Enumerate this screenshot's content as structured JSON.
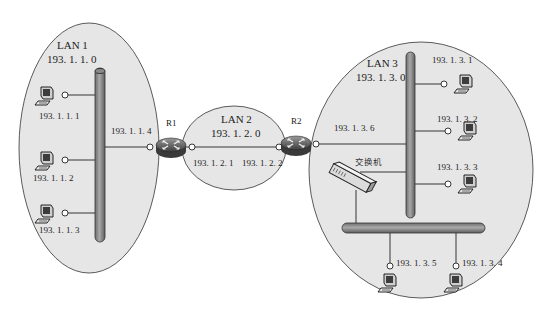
{
  "diagram": {
    "type": "network-topology",
    "colors": {
      "background": "#ffffff",
      "lan_fill": "#e6e6e6",
      "lan_stroke": "#333333",
      "bus_fill": "#8c8c8c",
      "link": "#222222",
      "router_body": "#5a5a5a"
    },
    "lans": [
      {
        "id": "lan1",
        "name": "LAN 1",
        "network": "193. 1. 1. 0"
      },
      {
        "id": "lan2",
        "name": "LAN 2",
        "network": "193. 1. 2. 0"
      },
      {
        "id": "lan3",
        "name": "LAN 3",
        "network": "193. 1. 3. 0"
      }
    ],
    "routers": [
      {
        "id": "r1",
        "label": "R1"
      },
      {
        "id": "r2",
        "label": "R2"
      }
    ],
    "switch": {
      "label": "交换机"
    },
    "interfaces": {
      "r1_lan1": "193. 1. 1. 4",
      "r1_lan2": "193. 1. 2. 1",
      "r2_lan2": "193. 1. 2. 2",
      "r2_lan3": "193. 1. 3. 6"
    },
    "hosts": {
      "lan1": [
        "193. 1. 1. 1",
        "193. 1. 1. 2",
        "193. 1. 1. 3"
      ],
      "lan3_bus": [
        "193. 1. 3. 1",
        "193. 1. 3. 2",
        "193. 1. 3. 3"
      ],
      "lan3_switch": [
        "193. 1. 3. 5",
        "193. 1. 3. 4"
      ]
    }
  }
}
